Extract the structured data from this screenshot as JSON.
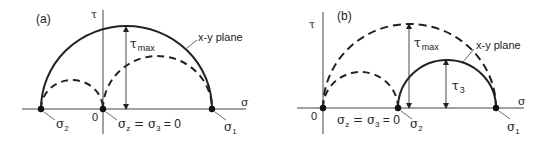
{
  "panels": [
    {
      "id": "a",
      "label": "(a)",
      "tau_axis_label": "τ",
      "sigma_axis_label": "σ",
      "origin_label": "0",
      "tau_max_label": "τ",
      "tau_max_sub": "max",
      "plane_label": "x-y plane",
      "sigma2_label": "σ",
      "sigma2_sub": "2",
      "sigma1_label": "σ",
      "sigma1_sub": "1",
      "sigmaz_label_main": "σ",
      "sigmaz_sub": "z",
      "sigmaz_eq": " = σ",
      "sigma3_sub": "3",
      "sigmaz_tail": " = 0"
    },
    {
      "id": "b",
      "label": "(b)",
      "tau_axis_label": "τ",
      "sigma_axis_label": "σ",
      "origin_label": "0",
      "tau_max_label": "τ",
      "tau_max_sub": "max",
      "tau3_label": "τ",
      "tau3_sub": "3",
      "plane_label": "x-y plane",
      "sigma2_label": "σ",
      "sigma2_sub": "2",
      "sigma1_label": "σ",
      "sigma1_sub": "1",
      "sigmaz_label_main": "σ",
      "sigmaz_sub": "z",
      "sigmaz_eq": " = σ",
      "sigma3_sub": "3",
      "sigmaz_tail": " = 0"
    }
  ],
  "colors": {
    "ink": "#222222",
    "background": "#ffffff"
  }
}
